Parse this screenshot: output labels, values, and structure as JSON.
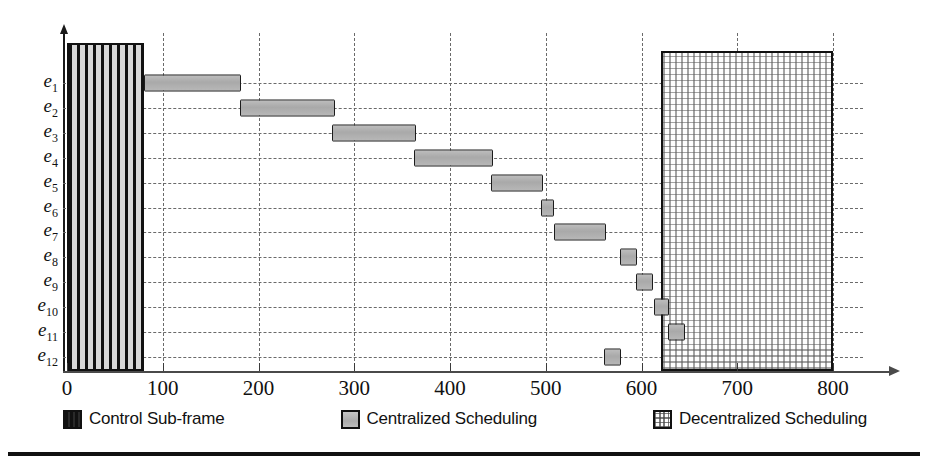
{
  "chart_data": {
    "type": "bar",
    "orientation": "horizontal",
    "subtype": "gantt",
    "title": "",
    "xlabel": "",
    "ylabel": "",
    "xlim": [
      0,
      830
    ],
    "ylim_categories": [
      "e1",
      "e2",
      "e3",
      "e4",
      "e5",
      "e6",
      "e7",
      "e8",
      "e9",
      "e10",
      "e11",
      "e12"
    ],
    "xticks": [
      0,
      100,
      200,
      300,
      400,
      500,
      600,
      700,
      800
    ],
    "xticklabels": [
      "0",
      "100",
      "200",
      "300",
      "400",
      "500",
      "600",
      "700",
      "800"
    ],
    "categories": [
      "e1",
      "e2",
      "e3",
      "e4",
      "e5",
      "e6",
      "e7",
      "e8",
      "e9",
      "e10",
      "e11",
      "e12"
    ],
    "category_labels": [
      {
        "base": "e",
        "sub": "1"
      },
      {
        "base": "e",
        "sub": "2"
      },
      {
        "base": "e",
        "sub": "3"
      },
      {
        "base": "e",
        "sub": "4"
      },
      {
        "base": "e",
        "sub": "5"
      },
      {
        "base": "e",
        "sub": "6"
      },
      {
        "base": "e",
        "sub": "7"
      },
      {
        "base": "e",
        "sub": "8"
      },
      {
        "base": "e",
        "sub": "9"
      },
      {
        "base": "e",
        "sub": "10"
      },
      {
        "base": "e",
        "sub": "11"
      },
      {
        "base": "e",
        "sub": "12"
      }
    ],
    "grid": {
      "vertical": true,
      "horizontal": true,
      "style": "dashed"
    },
    "legend": {
      "position": "below-axes",
      "entries": [
        {
          "label": "Control Sub-frame",
          "pattern": "vertical-stripes",
          "color": "#111111"
        },
        {
          "label": "Centralized Scheduling",
          "pattern": "solid-gray",
          "color": "#ababab"
        },
        {
          "label": "Decentralized Scheduling",
          "pattern": "dotted-grid",
          "color": "#9a9a9a"
        }
      ]
    },
    "series": [
      {
        "name": "Control Sub-frame",
        "type": "span-region",
        "start": 0,
        "end": 80,
        "spans_all_rows": true
      },
      {
        "name": "Centralized Scheduling",
        "type": "task-bars",
        "bars": [
          {
            "row": "e1",
            "start": 80,
            "end": 182,
            "duration": 102
          },
          {
            "row": "e2",
            "start": 181,
            "end": 280,
            "duration": 99
          },
          {
            "row": "e3",
            "start": 277,
            "end": 365,
            "duration": 88
          },
          {
            "row": "e4",
            "start": 362,
            "end": 445,
            "duration": 83
          },
          {
            "row": "e5",
            "start": 443,
            "end": 497,
            "duration": 54
          },
          {
            "row": "e6",
            "start": 495,
            "end": 509,
            "duration": 14
          },
          {
            "row": "e7",
            "start": 509,
            "end": 563,
            "duration": 54
          },
          {
            "row": "e8",
            "start": 578,
            "end": 595,
            "duration": 17
          },
          {
            "row": "e9",
            "start": 594,
            "end": 612,
            "duration": 18
          },
          {
            "row": "e10",
            "start": 613,
            "end": 629,
            "duration": 16
          },
          {
            "row": "e11",
            "start": 628,
            "end": 645,
            "duration": 17
          },
          {
            "row": "e12",
            "start": 561,
            "end": 579,
            "duration": 18
          }
        ]
      },
      {
        "name": "Decentralized Scheduling",
        "type": "span-region",
        "start": 620,
        "end": 800,
        "spans_all_rows": true
      }
    ]
  },
  "legend": {
    "entries": [
      {
        "label": "Control Sub-frame"
      },
      {
        "label": "Centralized Scheduling"
      },
      {
        "label": "Decentralized Scheduling"
      }
    ]
  }
}
